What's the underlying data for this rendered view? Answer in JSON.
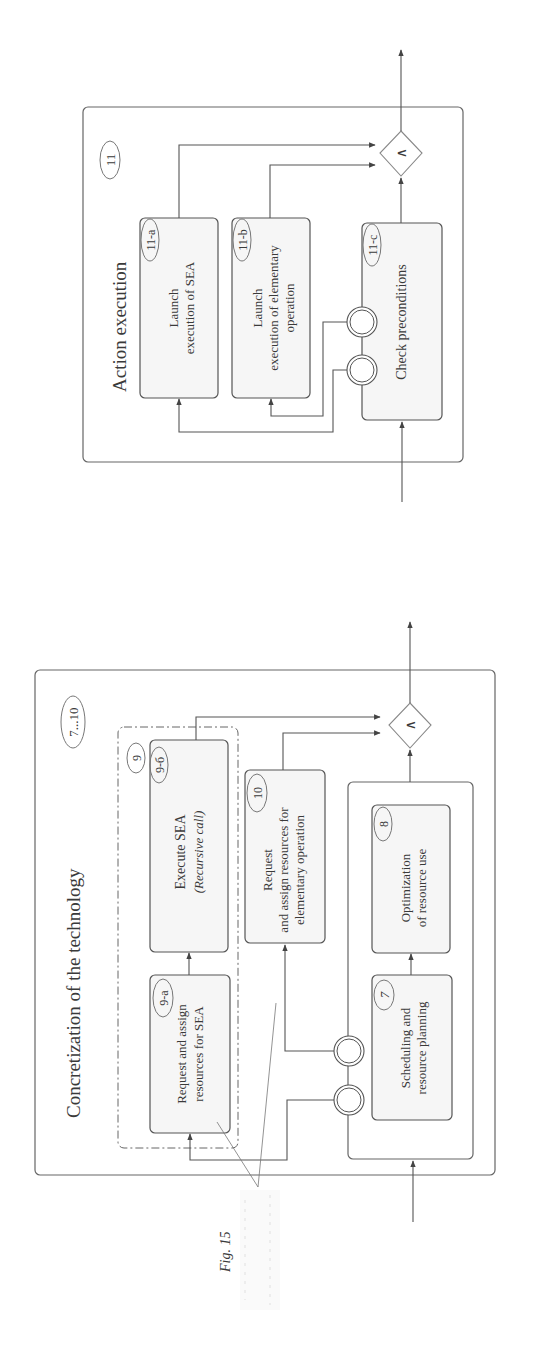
{
  "figure": {
    "caption": "Fig. 15",
    "orientation": "rotated 90° counter-clockwise"
  },
  "top_panel": {
    "title": "Action execution",
    "id_badge": "11",
    "blocks": [
      {
        "id": "11-a",
        "line1": "Launch",
        "line2": "execution of SEA",
        "line3": ""
      },
      {
        "id": "11-b",
        "line1": "Launch",
        "line2": "execution of elementary",
        "line3": "operation"
      },
      {
        "id": "11-c",
        "line1": "Check preconditions",
        "line2": "",
        "line3": ""
      }
    ],
    "join_symbol": "∧"
  },
  "bottom_panel": {
    "title": "Concretization of the technology",
    "id_badge": "7...10",
    "group_badge": "9",
    "blocks": [
      {
        "id": "9-a",
        "line1": "Request and assign",
        "line2": "resources for SEA"
      },
      {
        "id": "9-б",
        "line1": "Execute SEA",
        "line2": "(Recursive call)"
      },
      {
        "id": "10",
        "line1": "Request",
        "line2": "and assign resources for",
        "line3": "elementary operation"
      },
      {
        "id": "7",
        "line1": "Scheduling and",
        "line2": "resource planning"
      },
      {
        "id": "8",
        "line1": "Optimization",
        "line2": "of resource use"
      }
    ],
    "join_symbol": "∧"
  }
}
